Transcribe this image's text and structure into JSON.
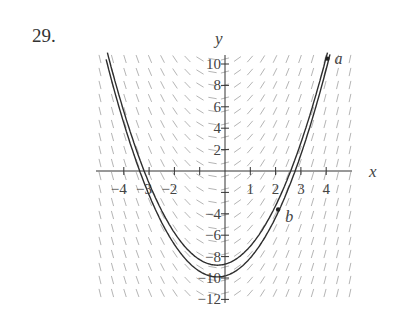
{
  "problem": {
    "number_label": "29."
  },
  "chart_data": {
    "type": "line",
    "xlabel": "x",
    "ylabel": "y",
    "xlim": [
      -4.6,
      5.0
    ],
    "ylim": [
      -12.2,
      10.8
    ],
    "x_ticks": [
      -4,
      -3,
      -2,
      -1,
      1,
      2,
      3,
      4
    ],
    "x_tick_labels": [
      "-4",
      "-3",
      "-2",
      "",
      "1",
      "2",
      "3",
      "4"
    ],
    "y_ticks": [
      10,
      8,
      6,
      4,
      2,
      -2,
      -4,
      -6,
      -8,
      -10,
      -12
    ],
    "y_tick_labels": [
      "10",
      "8",
      "6",
      "4",
      "2",
      "",
      "-4",
      "-6",
      "-8",
      "-10",
      "-12"
    ],
    "grid": false,
    "slope_field": {
      "description": "dy/dx depends on x only; slopes negative for x < 0, positive for x > 0",
      "slope_coefficient": 2.1,
      "x_shift": 0.3
    },
    "series": [
      {
        "name": "solution through a and b",
        "form": "y = 1.05(x+0.3)^2 - 9.9",
        "min_y": -9.9
      },
      {
        "name": "upper solution",
        "form": "y = 1.05(x+0.3)^2 - 8.8",
        "min_y": -8.8
      }
    ],
    "points": [
      {
        "label": "a",
        "x": 4.05,
        "y": 10.5
      },
      {
        "label": "b",
        "x": 2.1,
        "y": -3.6
      }
    ]
  },
  "layout": {
    "origin_px": [
      225,
      171
    ],
    "x_px_per_unit": 25.3,
    "y_px_per_unit": 10.7,
    "field_x_range_px": [
      96,
      352
    ],
    "field_y_range_px": [
      55,
      303
    ],
    "ink": "#333333",
    "field_ink": "#b5b5b5"
  }
}
